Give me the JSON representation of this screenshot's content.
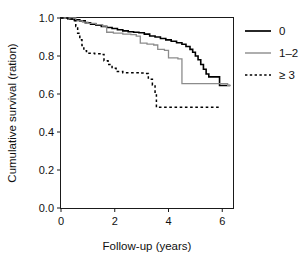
{
  "chart_data": {
    "type": "line",
    "subtype": "kaplan-meier-step",
    "title": "",
    "xlabel": "Follow-up (years)",
    "ylabel": "Cumulative survival (ration)",
    "xlim": [
      0,
      6.4
    ],
    "ylim": [
      0.0,
      1.0
    ],
    "xticks": [
      0,
      2,
      4,
      6
    ],
    "xtick_labels": [
      "0",
      "2",
      "4",
      "6"
    ],
    "yticks": [
      0.0,
      0.2,
      0.4,
      0.6,
      0.8,
      1.0
    ],
    "ytick_labels": [
      "0.0",
      "0.2",
      "0.4",
      "0.6",
      "0.8",
      "1.0"
    ],
    "grid": false,
    "legend_position": "right",
    "series": [
      {
        "name": "0",
        "label": "0",
        "color": "#000000",
        "style": "solid",
        "points": [
          [
            0.0,
            1.0
          ],
          [
            0.15,
            1.0
          ],
          [
            0.3,
            0.995
          ],
          [
            0.5,
            0.99
          ],
          [
            0.7,
            0.985
          ],
          [
            0.9,
            0.975
          ],
          [
            1.1,
            0.968
          ],
          [
            1.3,
            0.962
          ],
          [
            1.5,
            0.955
          ],
          [
            1.7,
            0.95
          ],
          [
            1.9,
            0.945
          ],
          [
            2.1,
            0.938
          ],
          [
            2.3,
            0.932
          ],
          [
            2.5,
            0.928
          ],
          [
            2.7,
            0.925
          ],
          [
            2.9,
            0.922
          ],
          [
            3.1,
            0.915
          ],
          [
            3.3,
            0.905
          ],
          [
            3.5,
            0.9
          ],
          [
            3.7,
            0.892
          ],
          [
            3.9,
            0.885
          ],
          [
            4.1,
            0.878
          ],
          [
            4.3,
            0.87
          ],
          [
            4.5,
            0.862
          ],
          [
            4.65,
            0.85
          ],
          [
            4.8,
            0.835
          ],
          [
            4.9,
            0.82
          ],
          [
            5.0,
            0.8
          ],
          [
            5.1,
            0.78
          ],
          [
            5.2,
            0.755
          ],
          [
            5.3,
            0.73
          ],
          [
            5.4,
            0.705
          ],
          [
            5.5,
            0.69
          ],
          [
            5.75,
            0.69
          ],
          [
            5.9,
            0.645
          ],
          [
            6.3,
            0.645
          ]
        ]
      },
      {
        "name": "1-2",
        "label": "1–2",
        "color": "#8c8c8c",
        "style": "solid",
        "points": [
          [
            0.0,
            1.0
          ],
          [
            0.35,
            1.0
          ],
          [
            0.55,
            0.985
          ],
          [
            0.8,
            0.978
          ],
          [
            1.0,
            0.972
          ],
          [
            1.3,
            0.965
          ],
          [
            1.55,
            0.958
          ],
          [
            1.7,
            0.925
          ],
          [
            1.95,
            0.92
          ],
          [
            2.3,
            0.915
          ],
          [
            2.6,
            0.912
          ],
          [
            2.8,
            0.905
          ],
          [
            2.95,
            0.868
          ],
          [
            3.2,
            0.862
          ],
          [
            3.45,
            0.858
          ],
          [
            3.6,
            0.835
          ],
          [
            3.85,
            0.83
          ],
          [
            4.0,
            0.79
          ],
          [
            4.35,
            0.785
          ],
          [
            4.5,
            0.655
          ],
          [
            5.85,
            0.655
          ],
          [
            6.2,
            0.645
          ],
          [
            6.3,
            0.645
          ]
        ]
      },
      {
        "name": ">=3",
        "label": "≥ 3",
        "color": "#000000",
        "style": "dashed",
        "points": [
          [
            0.0,
            1.0
          ],
          [
            0.25,
            0.995
          ],
          [
            0.45,
            0.985
          ],
          [
            0.55,
            0.955
          ],
          [
            0.62,
            0.92
          ],
          [
            0.7,
            0.885
          ],
          [
            0.78,
            0.855
          ],
          [
            0.85,
            0.828
          ],
          [
            0.95,
            0.815
          ],
          [
            1.25,
            0.812
          ],
          [
            1.45,
            0.808
          ],
          [
            1.6,
            0.775
          ],
          [
            1.75,
            0.755
          ],
          [
            1.9,
            0.735
          ],
          [
            2.05,
            0.718
          ],
          [
            2.3,
            0.712
          ],
          [
            2.9,
            0.71
          ],
          [
            3.1,
            0.708
          ],
          [
            3.25,
            0.678
          ],
          [
            3.4,
            0.648
          ],
          [
            3.5,
            0.6
          ],
          [
            3.55,
            0.53
          ],
          [
            5.95,
            0.53
          ]
        ]
      }
    ]
  },
  "legend": {
    "entries": [
      {
        "label": "0",
        "series": "0"
      },
      {
        "label": "1–2",
        "series": "1-2"
      },
      {
        "label": "≥ 3",
        "series": ">=3"
      }
    ]
  },
  "axes": {
    "x_title": "Follow-up (years)",
    "y_title": "Cumulative survival (ration)",
    "x_tick_labels": [
      "0",
      "2",
      "4",
      "6"
    ],
    "y_tick_labels": [
      "0.0",
      "0.2",
      "0.4",
      "0.6",
      "0.8",
      "1.0"
    ]
  }
}
